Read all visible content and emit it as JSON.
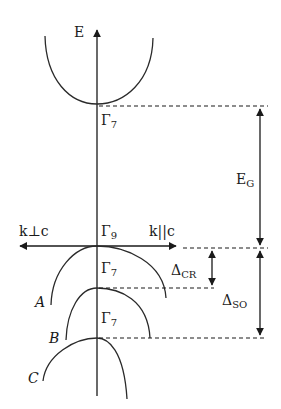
{
  "diagram": {
    "type": "band-structure",
    "colors": {
      "line": "#2a2a2a",
      "background": "#ffffff"
    },
    "axes": {
      "energy_label": "E",
      "k_perp_label": "k⊥c",
      "k_par_label": "k||c"
    },
    "points": {
      "conduction_min": {
        "symbol": "Γ",
        "subscript": "7"
      },
      "valence_A": {
        "symbol": "Γ",
        "subscript": "9"
      },
      "valence_B": {
        "symbol": "Γ",
        "subscript": "7"
      },
      "valence_C": {
        "symbol": "Γ",
        "subscript": "7"
      }
    },
    "bands": [
      {
        "id": "conduction",
        "label": ""
      },
      {
        "id": "A",
        "label": "A"
      },
      {
        "id": "B",
        "label": "B"
      },
      {
        "id": "C",
        "label": "C"
      }
    ],
    "gaps": {
      "band_gap": {
        "symbol": "E",
        "subscript": "G"
      },
      "crystal_field": {
        "symbol": "Δ",
        "subscript": "CR"
      },
      "spin_orbit": {
        "symbol": "Δ",
        "subscript": "SO"
      }
    }
  }
}
